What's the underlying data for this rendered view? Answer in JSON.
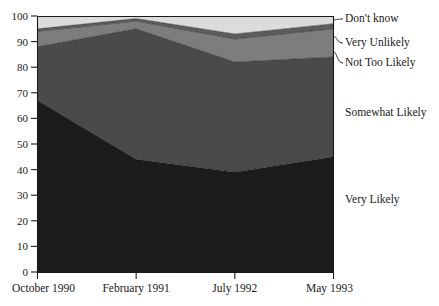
{
  "chart_data": {
    "type": "area",
    "stacked": true,
    "title": "",
    "subtitle": "",
    "xlabel": "",
    "ylabel": "",
    "categories": [
      "October 1990",
      "February 1991",
      "July 1992",
      "May 1993"
    ],
    "x": [
      "October 1990",
      "February 1991",
      "July 1992",
      "May 1993"
    ],
    "xlim": [
      0,
      3
    ],
    "ylim": [
      0,
      100
    ],
    "yticks": [
      0,
      10,
      20,
      30,
      40,
      50,
      60,
      70,
      80,
      90,
      100
    ],
    "ytick_labels": [
      "0",
      "10",
      "20",
      "30",
      "40",
      "50",
      "60",
      "70",
      "80",
      "90",
      "100"
    ],
    "xtick_labels": [
      "October 1990",
      "February 1991",
      "July 1992",
      "May 1993"
    ],
    "grid": false,
    "legend_position": "right-inline-labels",
    "series": [
      {
        "name": "Very Likely",
        "color": "#1c1c1c",
        "values": [
          67,
          44,
          39,
          45
        ],
        "label_y": 22
      },
      {
        "name": "Somewhat Likely",
        "color": "#4a4a4a",
        "values": [
          21,
          51,
          43,
          39
        ],
        "label_y": 64
      },
      {
        "name": "Not Too Likely",
        "color": "#7d7d7d",
        "values": [
          6,
          3,
          9,
          11
        ],
        "label_y": 83
      },
      {
        "name": "Very Unlikely",
        "color": "#5c5c5c",
        "values": [
          1,
          1,
          2,
          2
        ],
        "label_y": 90.5
      },
      {
        "name": "Don't know",
        "color": "#dcdcdc",
        "values": [
          5,
          1,
          7,
          3
        ],
        "label_y": 97
      }
    ],
    "cumulative_tops": [
      [
        67,
        44,
        39,
        45
      ],
      [
        88,
        95,
        82,
        84
      ],
      [
        94,
        98,
        91,
        95
      ],
      [
        95,
        99,
        93,
        97
      ],
      [
        100,
        100,
        100,
        100
      ]
    ]
  },
  "legend": {
    "items": [
      {
        "label": "Don't know"
      },
      {
        "label": "Very Unlikely"
      },
      {
        "label": "Not Too Likely"
      },
      {
        "label": "Somewhat Likely"
      },
      {
        "label": "Very Likely"
      }
    ]
  },
  "axes": {
    "y_ticks": [
      "100",
      "90",
      "80",
      "70",
      "60",
      "50",
      "40",
      "30",
      "20",
      "10",
      "0"
    ],
    "x_ticks": [
      "October 1990",
      "February 1991",
      "July 1992",
      "May 1993"
    ]
  },
  "colors": {
    "very_likely": "#1c1c1c",
    "somewhat_likely": "#4a4a4a",
    "not_too_likely": "#7d7d7d",
    "very_unlikely": "#5c5c5c",
    "dont_know": "#dcdcdc",
    "axis": "#1a1a1a",
    "background": "#ffffff"
  }
}
